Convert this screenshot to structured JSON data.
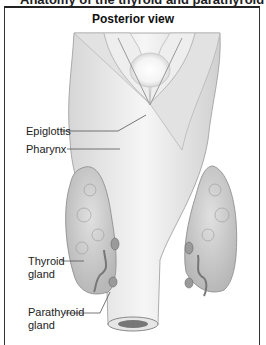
{
  "header": {
    "cut_title": "Anatomy of the thyroid and parathyroid glands"
  },
  "diagram": {
    "title": "Posterior view",
    "labels": [
      {
        "id": "epiglottis",
        "text": "Epiglottis"
      },
      {
        "id": "pharynx",
        "text": "Pharynx"
      },
      {
        "id": "thyroid",
        "line1": "Thyroid",
        "line2": "gland"
      },
      {
        "id": "parathyroid",
        "line1": "Parathyroid",
        "line2": "gland"
      }
    ],
    "colors": {
      "tissue": "#e8e8e8",
      "gland": "#c8c8c8",
      "dark": "#7a7a7a",
      "frame": "#333333"
    }
  }
}
